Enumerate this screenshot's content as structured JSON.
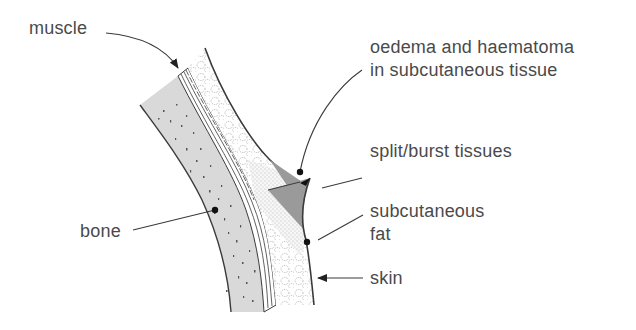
{
  "figure": {
    "labels": {
      "muscle": "muscle",
      "oedema_line1": "oedema and haematoma",
      "oedema_line2": "in subcutaneous tissue",
      "split": "split/burst tissues",
      "bone": "bone",
      "fat_line1": "subcutaneous",
      "fat_line2": "fat",
      "skin": "skin"
    },
    "colors": {
      "bone_fill": "#d9d9d9",
      "outline": "#3a3a3a",
      "text": "#4a4a4a",
      "wound_fill": "#9a9a9a",
      "background": "#ffffff"
    }
  }
}
